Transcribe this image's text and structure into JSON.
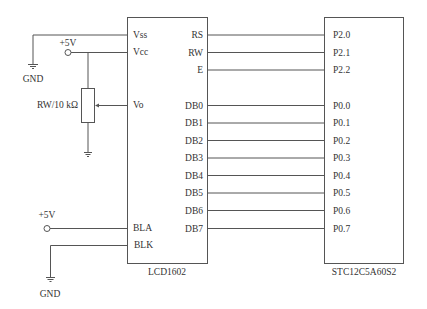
{
  "lcd": {
    "name": "LCD1602",
    "left_pins": {
      "vss": "Vss",
      "vcc": "Vcc",
      "vo": "Vo",
      "bla": "BLA",
      "blk": "BLK"
    },
    "right_pins": [
      "RS",
      "RW",
      "E",
      "DB0",
      "DB1",
      "DB2",
      "DB3",
      "DB4",
      "DB5",
      "DB6",
      "DB7"
    ]
  },
  "mcu": {
    "name": "STC12C5A60S2",
    "pins": [
      "P2.0",
      "P2.1",
      "P2.2",
      "P0.0",
      "P0.1",
      "P0.2",
      "P0.3",
      "P0.4",
      "P0.5",
      "P0.6",
      "P0.7"
    ]
  },
  "power": {
    "vcc_top": "+5V",
    "vcc_bottom": "+5V",
    "gnd_top": "GND",
    "gnd_bottom": "GND"
  },
  "potentiometer": {
    "label": "RW/10 kΩ"
  }
}
